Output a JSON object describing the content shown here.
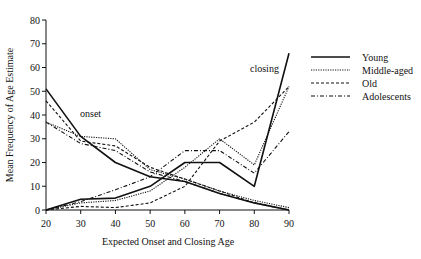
{
  "chart_data": {
    "type": "line",
    "title": "",
    "xlabel": "Expected Onset and Closing Age",
    "ylabel": "Mean Frequency of Age Estimate",
    "x": [
      20,
      30,
      40,
      50,
      60,
      70,
      80,
      90
    ],
    "xlim": [
      20,
      90
    ],
    "ylim": [
      0,
      80
    ],
    "xticks": [
      20,
      30,
      40,
      50,
      60,
      70,
      80,
      90
    ],
    "yticks": [
      0,
      10,
      20,
      30,
      40,
      50,
      60,
      70,
      80
    ],
    "grid": false,
    "legend_position": "right",
    "annotations": [
      {
        "text": "onset",
        "x": 30.5,
        "y": 40
      },
      {
        "text": "closing",
        "x": 79,
        "y": 59
      }
    ],
    "series": [
      {
        "name": "Young",
        "style": "solid",
        "group": "onset",
        "values": [
          51,
          31,
          20,
          14,
          12,
          7,
          3,
          0
        ]
      },
      {
        "name": "Middle-aged",
        "style": "dotted",
        "group": "onset",
        "values": [
          37,
          31,
          30,
          17,
          13,
          8,
          4,
          1
        ]
      },
      {
        "name": "Old",
        "style": "dashed",
        "group": "onset",
        "values": [
          46,
          29,
          27,
          18,
          13,
          8,
          3,
          0
        ]
      },
      {
        "name": "Adolescents",
        "style": "dashdot",
        "group": "onset",
        "values": [
          37,
          28,
          25,
          16,
          12,
          7,
          3,
          0
        ]
      },
      {
        "name": "Young",
        "style": "solid",
        "group": "closing",
        "values": [
          0,
          4.5,
          5,
          10,
          20,
          20,
          10,
          66
        ]
      },
      {
        "name": "Middle-aged",
        "style": "dotted",
        "group": "closing",
        "values": [
          0,
          3,
          4,
          8,
          18,
          30,
          19,
          52
        ]
      },
      {
        "name": "Old",
        "style": "dashed",
        "group": "closing",
        "values": [
          0,
          1.5,
          1,
          3,
          10,
          29,
          37,
          52
        ]
      },
      {
        "name": "Adolescents",
        "style": "dashdot",
        "group": "closing",
        "values": [
          0,
          3.5,
          8.5,
          14,
          25,
          25,
          15.5,
          33
        ]
      }
    ]
  },
  "legend": {
    "items": [
      {
        "label": "Young",
        "style": "solid"
      },
      {
        "label": "Middle-aged",
        "style": "dotted"
      },
      {
        "label": "Old",
        "style": "dashed"
      },
      {
        "label": "Adolescents",
        "style": "dashdot"
      }
    ]
  },
  "axes": {
    "xlabel": "Expected Onset and Closing Age",
    "ylabel": "Mean Frequency of Age Estimate"
  },
  "annotations": {
    "onset": "onset",
    "closing": "closing"
  }
}
